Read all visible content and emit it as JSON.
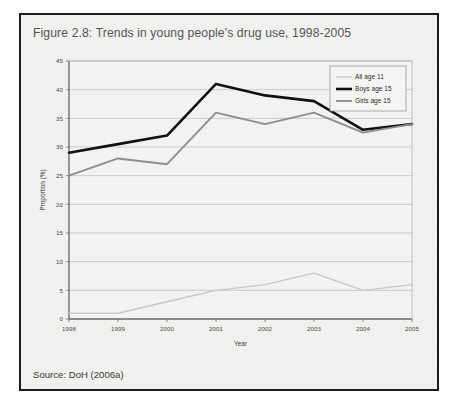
{
  "figure": {
    "caption": "Figure 2.8: Trends in young people's drug use, 1998-2005",
    "source": "Source: DoH (2006a)"
  },
  "chart_data": {
    "type": "line",
    "title": "Figure 2.8: Trends in young people's drug use, 1998-2005",
    "xlabel": "Year",
    "ylabel": "Proportion (%)",
    "categories": [
      "1998",
      "1999",
      "2000",
      "2001",
      "2002",
      "2003",
      "2004",
      "2005"
    ],
    "x": [
      1998,
      1999,
      2000,
      2001,
      2002,
      2003,
      2004,
      2005
    ],
    "ylim": [
      0,
      45
    ],
    "yticks": [
      0,
      5,
      10,
      15,
      20,
      25,
      30,
      35,
      40,
      45
    ],
    "ytick_labels": [
      "0",
      "5",
      "10",
      "15",
      "20",
      "25",
      "30",
      "35",
      "40",
      "45"
    ],
    "grid": true,
    "legend_position": "top-right",
    "series": [
      {
        "name": "All age 11",
        "color": "#c9c9c9",
        "width": 1.4,
        "values": [
          1,
          1,
          3,
          5,
          6,
          8,
          5,
          6
        ]
      },
      {
        "name": "Boys age 15",
        "color": "#111111",
        "width": 2.6,
        "values": [
          29,
          30.5,
          32,
          41,
          39,
          38,
          33,
          34
        ]
      },
      {
        "name": "Girls age 15",
        "color": "#8f8f8f",
        "width": 1.9,
        "values": [
          25,
          28,
          27,
          36,
          34,
          36,
          32.5,
          34
        ]
      }
    ]
  },
  "colors": {
    "frame_border": "#1c1c1c",
    "panel_background": "#f2f2f0",
    "gridline": "#b9b9b9",
    "axis_line": "#6f6f6f",
    "caption_text": "#555555",
    "source_text": "#3a3a3a"
  }
}
